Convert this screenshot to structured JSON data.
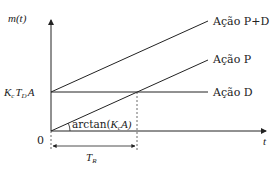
{
  "diagram": {
    "y_axis_label": "m(t)",
    "x_axis_label": "t",
    "origin_label": "0",
    "level_label": "K_c T_D A",
    "level_label_parts": {
      "K": "K",
      "c": "c",
      "T": "T",
      "D": "D",
      "A": "A"
    },
    "angle_label": "arctan(K_c A)",
    "angle_label_parts": {
      "prefix": "arctan(",
      "K": "K",
      "c": "c",
      "suffix": "A)"
    },
    "interval_label": "T_R",
    "interval_label_parts": {
      "T": "T",
      "R": "R"
    },
    "curves": [
      {
        "id": "pd",
        "label": "Ação P+D"
      },
      {
        "id": "p",
        "label": "Ação P"
      },
      {
        "id": "d",
        "label": "Ação D"
      }
    ],
    "line_color": "#222222"
  }
}
